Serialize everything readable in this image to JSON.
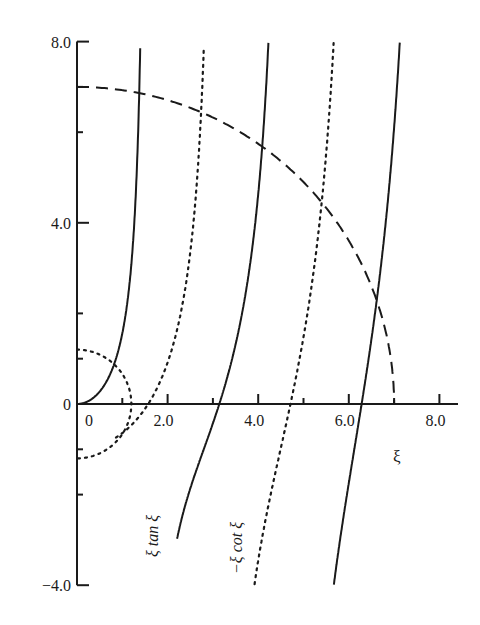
{
  "chart_data": {
    "type": "line",
    "title": "",
    "xlabel": "ξ",
    "ylabel": "",
    "xlim": [
      0,
      8.2
    ],
    "ylim": [
      -4.0,
      8.0
    ],
    "grid": false,
    "legend": "none (curves labeled inline)",
    "x_ticks": [
      {
        "value": 0,
        "label": "0"
      },
      {
        "value": 1.0,
        "label": ""
      },
      {
        "value": 2.0,
        "label": "2.0"
      },
      {
        "value": 3.0,
        "label": ""
      },
      {
        "value": 4.0,
        "label": "4.0"
      },
      {
        "value": 5.0,
        "label": ""
      },
      {
        "value": 6.0,
        "label": "6.0"
      },
      {
        "value": 7.0,
        "label": ""
      },
      {
        "value": 8.0,
        "label": "8.0"
      }
    ],
    "y_ticks": [
      {
        "value": 8.0,
        "label": "8.0"
      },
      {
        "value": 7.0,
        "label": ""
      },
      {
        "value": 6.0,
        "label": ""
      },
      {
        "value": 4.0,
        "label": "4.0"
      },
      {
        "value": 2.0,
        "label": ""
      },
      {
        "value": 1.0,
        "label": ""
      },
      {
        "value": 0,
        "label": "0"
      },
      {
        "value": -1.0,
        "label": ""
      },
      {
        "value": -2.0,
        "label": ""
      },
      {
        "value": -4.0,
        "label": "−4.0"
      }
    ],
    "series": [
      {
        "name": "ξ tan ξ",
        "style": "solid",
        "function": "x*tan(x)",
        "branches": [
          [
            0,
            1.43
          ],
          [
            2.21,
            4.55
          ],
          [
            5.08,
            7.7
          ]
        ],
        "label": "ξ tan ξ"
      },
      {
        "name": "−ξ cot ξ",
        "style": "dotted",
        "function": "-x/tan(x)",
        "branches": [
          [
            0.86,
            3.0
          ],
          [
            3.88,
            6.2
          ]
        ],
        "label": "−ξ cot ξ"
      },
      {
        "name": "large circle ξ²+η²=R²",
        "style": "dashed",
        "radius": 7.0
      },
      {
        "name": "small circle ξ²+η²=r²",
        "style": "dotted",
        "radius": 1.2
      }
    ],
    "intersections": [
      {
        "x": 1.0,
        "y": 0.95,
        "note": "ξ tan ξ with small circle"
      },
      {
        "x": 1.3,
        "y": 6.87,
        "note": "ξ tan ξ with large circle"
      },
      {
        "x": 2.6,
        "y": 6.5,
        "note": "−ξ cot ξ with large circle"
      },
      {
        "x": 3.9,
        "y": 5.8,
        "note": "ξ tan ξ with large circle"
      },
      {
        "x": 5.2,
        "y": 4.7,
        "note": "−ξ cot ξ with large circle"
      },
      {
        "x": 6.4,
        "y": 2.7,
        "note": "ξ tan ξ with large circle"
      }
    ]
  },
  "labels": {
    "x_axis": "ξ",
    "tan_curve": "ξ tan ξ",
    "cot_curve": "−ξ cot ξ"
  },
  "colors": {
    "ink": "#1a1a1a",
    "background": "#ffffff"
  }
}
